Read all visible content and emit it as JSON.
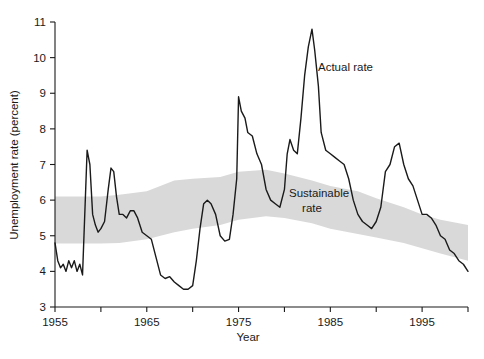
{
  "figure": {
    "background": "#ffffff",
    "line_color": "#1a1a1a",
    "band_color": "#d9d9d9",
    "axis_color": "#1a1a1a"
  },
  "annotations": {
    "actual_rate": "Actual rate",
    "sustainable_rate_line1": "Sustainable",
    "sustainable_rate_line2": "rate"
  },
  "chart_data": {
    "type": "line",
    "title": "",
    "xlabel": "Year",
    "ylabel": "Unemployment rate (percent)",
    "xlim": [
      1955,
      2000
    ],
    "ylim": [
      3,
      11
    ],
    "grid": false,
    "legend": "none",
    "xticks": [
      1955,
      1960,
      1965,
      1970,
      1975,
      1980,
      1985,
      1990,
      1995,
      2000
    ],
    "xtick_labels": [
      "1955",
      "",
      "1965",
      "",
      "1975",
      "",
      "1985",
      "",
      "1995",
      ""
    ],
    "yticks": [
      3,
      4,
      5,
      6,
      7,
      8,
      9,
      10,
      11
    ],
    "ytick_labels": [
      "3",
      "4",
      "5",
      "6",
      "7",
      "8",
      "9",
      "10",
      "11"
    ],
    "annotations": [
      {
        "text": "Actual rate",
        "x": 1985.2,
        "y": 9.55
      },
      {
        "text": "Sustainable rate",
        "x": 1983.0,
        "y": 5.85
      }
    ],
    "series": [
      {
        "name": "Actual rate",
        "style": "line",
        "color": "#1a1a1a",
        "x": [
          1955.0,
          1955.3,
          1955.6,
          1955.9,
          1956.2,
          1956.5,
          1956.8,
          1957.1,
          1957.4,
          1957.7,
          1958.0,
          1958.3,
          1958.5,
          1958.8,
          1959.1,
          1959.4,
          1959.7,
          1960.0,
          1960.4,
          1960.8,
          1961.1,
          1961.4,
          1961.7,
          1962.0,
          1962.4,
          1962.8,
          1963.2,
          1963.6,
          1964.0,
          1964.5,
          1965.0,
          1965.5,
          1966.0,
          1966.5,
          1967.0,
          1967.5,
          1968.0,
          1968.5,
          1969.0,
          1969.5,
          1970.0,
          1970.4,
          1970.8,
          1971.2,
          1971.6,
          1972.0,
          1972.5,
          1973.0,
          1973.5,
          1974.0,
          1974.4,
          1974.8,
          1975.0,
          1975.3,
          1975.7,
          1976.0,
          1976.5,
          1977.0,
          1977.5,
          1978.0,
          1978.5,
          1979.0,
          1979.5,
          1980.0,
          1980.3,
          1980.6,
          1981.0,
          1981.4,
          1981.8,
          1982.2,
          1982.6,
          1983.0,
          1983.3,
          1983.7,
          1984.0,
          1984.5,
          1985.0,
          1985.5,
          1986.0,
          1986.5,
          1987.0,
          1987.5,
          1988.0,
          1988.5,
          1989.0,
          1989.5,
          1990.0,
          1990.5,
          1991.0,
          1991.5,
          1992.0,
          1992.5,
          1993.0,
          1993.5,
          1994.0,
          1994.5,
          1995.0,
          1995.5,
          1996.0,
          1996.5,
          1997.0,
          1997.5,
          1998.0,
          1998.5,
          1999.0,
          1999.5,
          2000.0
        ],
        "y": [
          4.8,
          4.3,
          4.1,
          4.2,
          4.0,
          4.3,
          4.1,
          4.3,
          4.0,
          4.2,
          3.9,
          6.0,
          7.4,
          7.0,
          5.6,
          5.3,
          5.1,
          5.2,
          5.4,
          6.3,
          6.9,
          6.8,
          6.1,
          5.6,
          5.6,
          5.5,
          5.7,
          5.7,
          5.5,
          5.1,
          5.0,
          4.9,
          4.4,
          3.9,
          3.8,
          3.85,
          3.7,
          3.6,
          3.5,
          3.5,
          3.6,
          4.3,
          5.2,
          5.9,
          6.0,
          5.9,
          5.6,
          5.0,
          4.85,
          4.9,
          5.6,
          6.6,
          8.9,
          8.5,
          8.3,
          7.9,
          7.8,
          7.3,
          7.0,
          6.3,
          6.0,
          5.9,
          5.8,
          6.3,
          7.3,
          7.7,
          7.4,
          7.3,
          8.3,
          9.5,
          10.3,
          10.8,
          10.2,
          9.2,
          7.9,
          7.4,
          7.3,
          7.2,
          7.1,
          7.0,
          6.6,
          6.0,
          5.6,
          5.4,
          5.3,
          5.2,
          5.4,
          5.8,
          6.8,
          7.0,
          7.5,
          7.6,
          7.0,
          6.6,
          6.4,
          6.0,
          5.6,
          5.6,
          5.5,
          5.3,
          5.0,
          4.9,
          4.6,
          4.5,
          4.3,
          4.2,
          4.0
        ]
      },
      {
        "name": "Sustainable rate",
        "style": "band",
        "color": "#d9d9d9",
        "x": [
          1955,
          1960,
          1962,
          1965,
          1968,
          1970,
          1973,
          1975,
          1978,
          1980,
          1983,
          1985,
          1988,
          1990,
          1993,
          1995,
          1997,
          2000
        ],
        "y_upper": [
          6.1,
          6.1,
          6.15,
          6.25,
          6.55,
          6.6,
          6.65,
          6.8,
          6.85,
          6.75,
          6.55,
          6.4,
          6.25,
          6.05,
          5.8,
          5.6,
          5.45,
          5.3
        ],
        "y_lower": [
          4.78,
          4.78,
          4.8,
          4.9,
          5.1,
          5.2,
          5.3,
          5.45,
          5.55,
          5.5,
          5.35,
          5.2,
          5.05,
          4.95,
          4.8,
          4.65,
          4.5,
          4.3
        ]
      }
    ]
  }
}
